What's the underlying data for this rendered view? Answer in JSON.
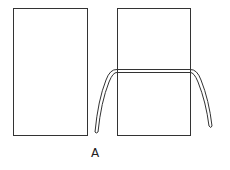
{
  "figure": {
    "label": "A",
    "stroke_color": "#333333",
    "elements": [
      {
        "name": "left-panel",
        "shape": "rectangle"
      },
      {
        "name": "right-panel",
        "shape": "rectangle"
      },
      {
        "name": "horizontal-band",
        "shape": "double-line"
      },
      {
        "name": "left-tube",
        "shape": "curved-tube"
      },
      {
        "name": "right-tube",
        "shape": "curved-tube"
      }
    ]
  }
}
